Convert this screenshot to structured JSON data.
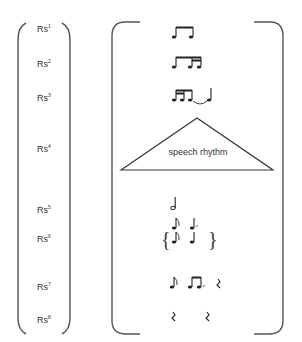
{
  "diagram": {
    "levels": [
      {
        "id": "rs1",
        "label": "Rs",
        "sup": "1",
        "y": 29,
        "rhythm": "two beamed eighth notes"
      },
      {
        "id": "rs2",
        "label": "Rs",
        "sup": "2",
        "y": 63,
        "rhythm": "eighth pair + sixteenth pair"
      },
      {
        "id": "rs3",
        "label": "Rs",
        "sup": "3",
        "y": 97,
        "rhythm": "sixteenth-eighth group tied to half note"
      },
      {
        "id": "rs4",
        "label": "Rs",
        "sup": "4",
        "y": 148,
        "rhythm": "speech rhythm"
      },
      {
        "id": "rs5",
        "label": "Rs",
        "sup": "5",
        "y": 210,
        "rhythm": "half note"
      },
      {
        "id": "rs6",
        "label": "Rs",
        "sup": "6",
        "y": 240,
        "rhythm": "eighth / quarter alternatives"
      },
      {
        "id": "rs7",
        "label": "Rs",
        "sup": "7",
        "y": 285,
        "rhythm": "eighth, dotted beamed pair, rest"
      },
      {
        "id": "rs8",
        "label": "Rs",
        "sup": "8",
        "y": 318,
        "rhythm": "rest, rest"
      }
    ],
    "triangle_label": "speech rhythm",
    "colors": {
      "stroke": "#444444",
      "text": "#333333"
    }
  }
}
